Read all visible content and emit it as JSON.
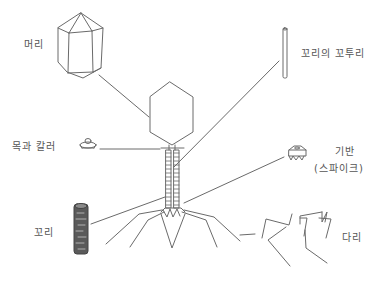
{
  "labels": {
    "head": "머리",
    "tail_core": "꼬리의 꼬투리",
    "neck_collar": "목과 칼러",
    "base_plate": "기반",
    "spikes": "(스파이크)",
    "tail": "꼬리",
    "legs": "다리"
  },
  "colors": {
    "stroke": "#6a6a6a",
    "text": "#555555",
    "background": "#ffffff"
  }
}
